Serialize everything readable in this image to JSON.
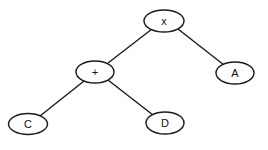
{
  "diagram": {
    "type": "expression-tree",
    "nodes": [
      {
        "id": "root",
        "label": "x",
        "cx": 164,
        "cy": 21
      },
      {
        "id": "plus",
        "label": "+",
        "cx": 95,
        "cy": 72
      },
      {
        "id": "a",
        "label": "A",
        "cx": 235,
        "cy": 73
      },
      {
        "id": "c",
        "label": "C",
        "cx": 28,
        "cy": 124
      },
      {
        "id": "d",
        "label": "D",
        "cx": 165,
        "cy": 123
      }
    ],
    "edges": [
      {
        "from": "root",
        "to": "plus"
      },
      {
        "from": "root",
        "to": "a"
      },
      {
        "from": "plus",
        "to": "c"
      },
      {
        "from": "plus",
        "to": "d"
      }
    ],
    "colors": {
      "stroke": "#1a1a1a",
      "background": "#ffffff"
    }
  }
}
